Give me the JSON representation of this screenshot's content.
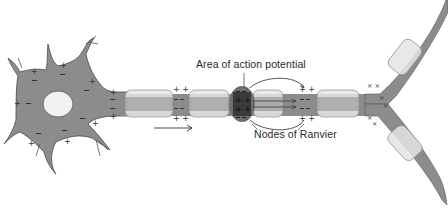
{
  "diagram": {
    "labels": {
      "action_potential": "Area of action potential",
      "nodes": "Nodes of Ranvier"
    },
    "parts": [
      {
        "id": "cell-body",
        "name": "Neuron cell body with nucleus",
        "charges": "positive outside, negative inside"
      },
      {
        "id": "axon",
        "name": "Myelinated axon"
      },
      {
        "id": "myelin-sheath",
        "name": "Myelin sheath segments",
        "count_main_axon": 5,
        "count_branches": 2
      },
      {
        "id": "action-potential-node",
        "name": "Node with active action potential",
        "charges": "negative outside, positive inside"
      },
      {
        "id": "local-currents",
        "name": "Local current loops flowing ahead to next node"
      },
      {
        "id": "direction-arrow",
        "name": "Direction of impulse propagation",
        "direction": "right"
      },
      {
        "id": "axon-terminal",
        "name": "Branching axon terminal (Y-shaped)"
      }
    ],
    "colors": {
      "cytoplasm": "#8c8c8c",
      "myelin": "#e4e4e4",
      "active_node": "#3a3a3a",
      "active_halo": "#6e6e6e",
      "outline": "#555555",
      "nucleus": "#f2f2f2"
    }
  }
}
